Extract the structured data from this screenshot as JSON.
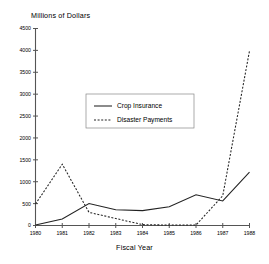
{
  "chart_data": {
    "type": "line",
    "title": "",
    "ylabel": "Millions of Dollars",
    "xlabel": "Fiscal Year",
    "categories": [
      "1980",
      "1981",
      "1982",
      "1983",
      "1984",
      "1985",
      "1986",
      "1987",
      "1988"
    ],
    "x": [
      1980,
      1981,
      1982,
      1983,
      1984,
      1985,
      1986,
      1987,
      1988
    ],
    "xlim": [
      1980,
      1988
    ],
    "ylim": [
      0,
      4500
    ],
    "ytick_values": [
      0,
      500,
      1000,
      1500,
      2000,
      2500,
      3000,
      3500,
      4000,
      4500
    ],
    "ytick_labels": [
      "0",
      "500",
      "1000",
      "1500",
      "2000",
      "2500",
      "3000",
      "3500",
      "4000",
      "4500"
    ],
    "grid": false,
    "legend_position": "upper-center",
    "series": [
      {
        "name": "Crop Insurance",
        "style": "solid",
        "values": [
          10,
          150,
          500,
          360,
          340,
          430,
          700,
          560,
          1220
        ]
      },
      {
        "name": "Disaster Payments",
        "style": "dashed",
        "values": [
          490,
          1400,
          300,
          160,
          20,
          10,
          10,
          680,
          3990
        ]
      }
    ]
  },
  "legend": {
    "items": [
      {
        "label": "Crop Insurance",
        "style": "solid"
      },
      {
        "label": "Disaster Payments",
        "style": "dashed"
      }
    ]
  }
}
